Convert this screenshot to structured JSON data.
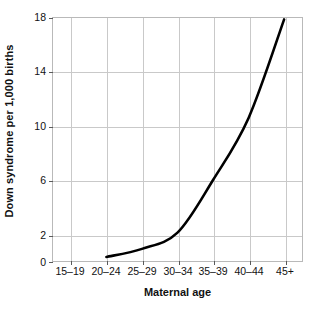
{
  "chart_data": {
    "type": "line",
    "title": "",
    "xlabel": "Maternal age",
    "ylabel": "Down syndrome per 1,000 births",
    "categories": [
      "15–19",
      "20–24",
      "25–29",
      "30–34",
      "35–39",
      "40–44",
      "45+"
    ],
    "xtick_labels": [
      "15–19",
      "20–24",
      "25–29",
      "30–34",
      "35–39",
      "40–44",
      "45+"
    ],
    "ytick_labels": [
      "0",
      "2",
      "6",
      "10",
      "14",
      "18"
    ],
    "ytick_values": [
      0,
      2,
      6,
      10,
      14,
      18
    ],
    "ylim": [
      0,
      18
    ],
    "grid": true,
    "legend": "none",
    "series": [
      {
        "name": "Down syndrome incidence",
        "color": "#000000",
        "values": [
          null,
          0.3,
          0.9,
          2.1,
          6.0,
          10.6,
          17.9
        ],
        "points": [
          {
            "x": "20–24",
            "y": 0.3
          },
          {
            "x": "25–29",
            "y": 0.9
          },
          {
            "x": "30–34",
            "y": 2.1
          },
          {
            "x": "35–39",
            "y": 6.0
          },
          {
            "x": "40–44",
            "y": 10.6
          },
          {
            "x": "45+",
            "y": 17.9
          }
        ]
      }
    ]
  },
  "style": {
    "grid_color": "#c9c9c9",
    "axis_color": "#b9b9b9",
    "line_color": "#000000",
    "text_color": "#111111",
    "background": "#ffffff"
  }
}
